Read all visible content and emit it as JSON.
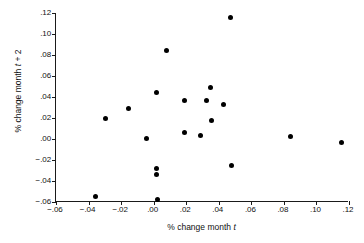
{
  "chart_data": {
    "type": "scatter",
    "title": "",
    "xlabel": "% change month t",
    "ylabel": "% change month t + 2",
    "xlim": [
      -0.06,
      0.12
    ],
    "ylim": [
      -0.06,
      0.12
    ],
    "xticks": [
      -0.06,
      -0.04,
      -0.02,
      0.0,
      0.02,
      0.04,
      0.06,
      0.08,
      0.1,
      0.12
    ],
    "yticks": [
      -0.06,
      -0.04,
      -0.02,
      0.0,
      0.02,
      0.04,
      0.06,
      0.08,
      0.1,
      0.12
    ],
    "xticklabels": [
      "−.06",
      "−.04",
      "−.02",
      ".00",
      ".02",
      ".04",
      ".06",
      ".08",
      ".10",
      ".12"
    ],
    "yticklabels": [
      "−.06",
      "−.04",
      "−.02",
      ".00",
      ".02",
      ".04",
      ".06",
      ".08",
      ".10",
      ".12"
    ],
    "grid": false,
    "legend": false,
    "marker": "filled-circle",
    "marker_color": "#000000",
    "points": [
      {
        "x": -0.0355,
        "y": -0.0545
      },
      {
        "x": -0.0295,
        "y": 0.0197
      },
      {
        "x": -0.0155,
        "y": 0.0295
      },
      {
        "x": -0.0045,
        "y": 0.0008
      },
      {
        "x": 0.0015,
        "y": 0.044
      },
      {
        "x": 0.0018,
        "y": -0.0277
      },
      {
        "x": 0.002,
        "y": -0.0342
      },
      {
        "x": 0.0022,
        "y": -0.0578
      },
      {
        "x": 0.008,
        "y": 0.084
      },
      {
        "x": 0.0188,
        "y": 0.0363
      },
      {
        "x": 0.0192,
        "y": 0.0066
      },
      {
        "x": 0.029,
        "y": 0.0032
      },
      {
        "x": 0.0325,
        "y": 0.0368
      },
      {
        "x": 0.0352,
        "y": 0.0487
      },
      {
        "x": 0.0355,
        "y": 0.018
      },
      {
        "x": 0.0428,
        "y": 0.0333
      },
      {
        "x": 0.0472,
        "y": 0.116
      },
      {
        "x": 0.0478,
        "y": -0.0255
      },
      {
        "x": 0.084,
        "y": 0.0024
      },
      {
        "x": 0.1152,
        "y": -0.0032
      }
    ]
  },
  "axis_titles": {
    "x_prefix": "% change month ",
    "x_var": "t",
    "y_prefix": "% change month ",
    "y_var": "t",
    "y_suffix": " + 2"
  }
}
